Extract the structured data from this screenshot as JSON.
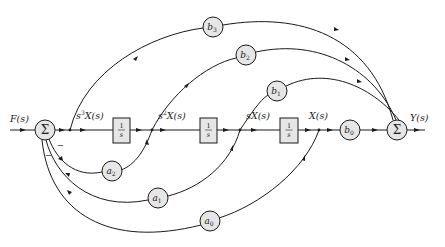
{
  "diagram": {
    "type": "block-diagram",
    "input": {
      "label": "F(s)"
    },
    "output": {
      "label": "Y(s)"
    },
    "summers": [
      {
        "id": "sum_in",
        "symbol": "Σ",
        "feedback_sign": "−"
      },
      {
        "id": "sum_out",
        "symbol": "Σ"
      }
    ],
    "signals": [
      {
        "id": "s3x",
        "label_prefix": "s",
        "label_exp": "3",
        "label_suffix": "X(s)"
      },
      {
        "id": "s2x",
        "label_prefix": "s",
        "label_exp": "2",
        "label_suffix": "X(s)"
      },
      {
        "id": "sx",
        "label": "sX(s)"
      },
      {
        "id": "x",
        "label": "X(s)"
      }
    ],
    "integrators": [
      {
        "id": "int1",
        "num": "1",
        "den": "s"
      },
      {
        "id": "int2",
        "num": "1",
        "den": "s"
      },
      {
        "id": "int3",
        "num": "1",
        "den": "s"
      }
    ],
    "feedforward_gains": [
      {
        "id": "b3",
        "base": "b",
        "sub": "3"
      },
      {
        "id": "b2",
        "base": "b",
        "sub": "2"
      },
      {
        "id": "b1",
        "base": "b",
        "sub": "1"
      },
      {
        "id": "b0",
        "base": "b",
        "sub": "0"
      }
    ],
    "feedback_gains": [
      {
        "id": "a2",
        "base": "a",
        "sub": "2"
      },
      {
        "id": "a1",
        "base": "a",
        "sub": "1"
      },
      {
        "id": "a0",
        "base": "a",
        "sub": "0"
      }
    ],
    "colors": {
      "line": "#1a1a1a",
      "block_fill": "#e6e6e6",
      "background": "#ffffff"
    }
  }
}
